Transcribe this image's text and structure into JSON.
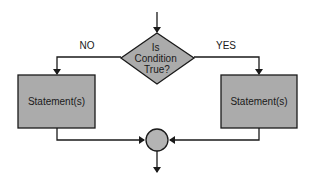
{
  "diagram": {
    "type": "flowchart-if-else",
    "colors": {
      "shape_fill": "#ababab",
      "junction_fill": "#b4b4b4",
      "stroke": "#1a1a1a",
      "background": "#ffffff"
    },
    "decision": {
      "lines": [
        "Is",
        "Condition",
        "True?"
      ]
    },
    "branches": {
      "no_label": "NO",
      "yes_label": "YES"
    },
    "left_box": {
      "label": "Statement(s)"
    },
    "right_box": {
      "label": "Statement(s)"
    },
    "junction": {
      "shape": "circle"
    }
  }
}
